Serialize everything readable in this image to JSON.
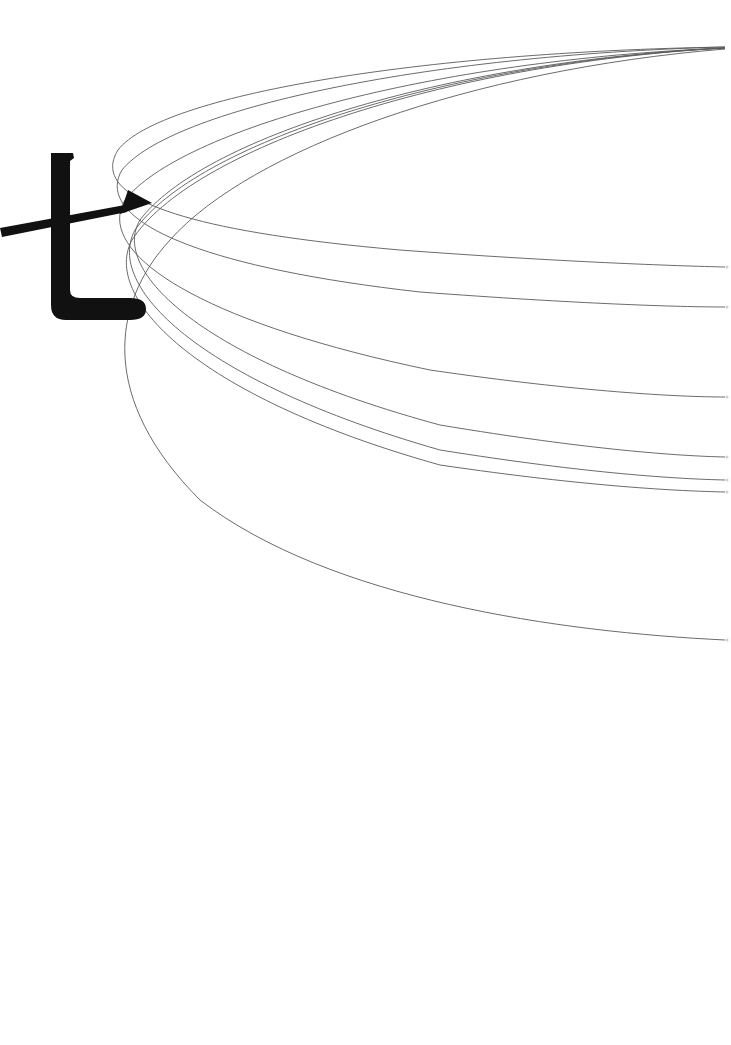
{
  "artwork": {
    "glyph": "七",
    "glyph_color": "#111111",
    "line_color": "#5a5a5a",
    "background": "#ffffff",
    "convergence_point": [
      725,
      47
    ],
    "arrow": {
      "from": [
        0,
        232
      ],
      "tip": [
        152,
        203
      ]
    },
    "arcs": [
      {
        "end_y": 267
      },
      {
        "end_y": 307
      },
      {
        "end_y": 397
      },
      {
        "end_y": 457
      },
      {
        "end_y": 480
      },
      {
        "end_y": 492
      },
      {
        "end_y": 640
      }
    ]
  }
}
